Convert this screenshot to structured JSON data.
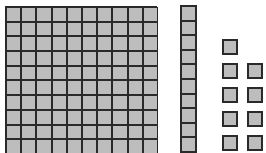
{
  "diagram": {
    "type": "base-ten-blocks",
    "hundreds": 1,
    "tens": 1,
    "ones": 9,
    "represented_value": 119,
    "colors": {
      "fill": "#bdbdbd",
      "stroke": "#2a2a2a",
      "background": "#ffffff"
    }
  },
  "units": [
    {
      "x": 222,
      "y": 39
    },
    {
      "x": 222,
      "y": 63
    },
    {
      "x": 247,
      "y": 63
    },
    {
      "x": 222,
      "y": 87
    },
    {
      "x": 247,
      "y": 87
    },
    {
      "x": 222,
      "y": 111
    },
    {
      "x": 247,
      "y": 111
    },
    {
      "x": 222,
      "y": 135
    },
    {
      "x": 247,
      "y": 135
    }
  ]
}
